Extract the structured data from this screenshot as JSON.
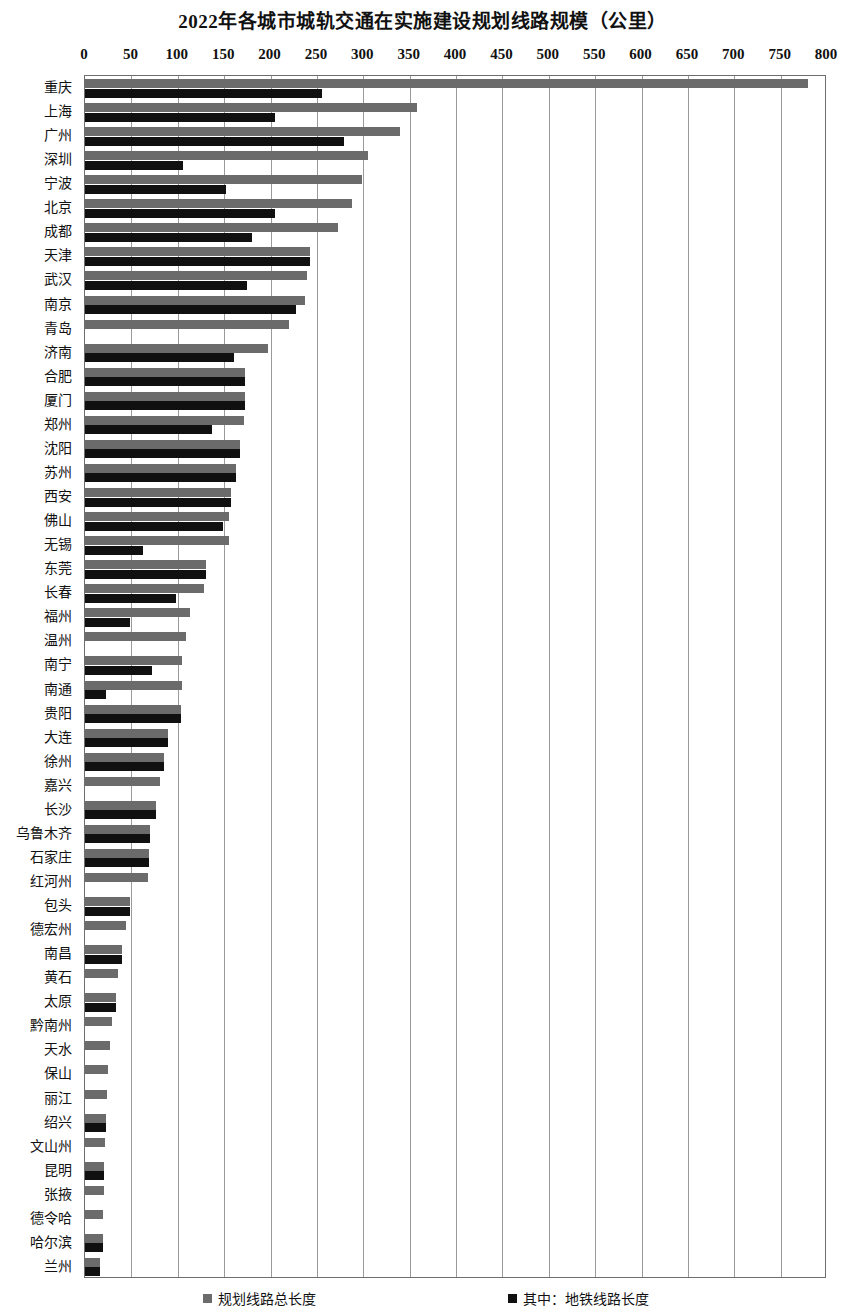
{
  "title": "2022年各城市城轨交通在实施建设规划线路规模（公里）",
  "legend": {
    "total": {
      "label": "规划线路总长度",
      "color": "#6b6b6b",
      "swatch_icon": "square-swatch-gray"
    },
    "metro": {
      "label": "其中：地铁线路长度",
      "color": "#101010",
      "swatch_icon": "square-swatch-black"
    }
  },
  "axis": {
    "ticks": [
      "0",
      "50",
      "100",
      "150",
      "200",
      "250",
      "300",
      "350",
      "400",
      "450",
      "500",
      "550",
      "600",
      "650",
      "700",
      "750",
      "800"
    ]
  },
  "chart_data": {
    "type": "bar",
    "orientation": "horizontal",
    "title": "2022年各城市城轨交通在实施建设规划线路规模（公里）",
    "xlabel": "",
    "ylabel": "",
    "xlim": [
      0,
      800
    ],
    "xticks": [
      0,
      50,
      100,
      150,
      200,
      250,
      300,
      350,
      400,
      450,
      500,
      550,
      600,
      650,
      700,
      750,
      800
    ],
    "grid": "vertical",
    "legend_position": "bottom",
    "categories": [
      "重庆",
      "上海",
      "广州",
      "深圳",
      "宁波",
      "北京",
      "成都",
      "天津",
      "武汉",
      "南京",
      "青岛",
      "济南",
      "合肥",
      "厦门",
      "郑州",
      "沈阳",
      "苏州",
      "西安",
      "佛山",
      "无锡",
      "东莞",
      "长春",
      "福州",
      "温州",
      "南宁",
      "南通",
      "贵阳",
      "大连",
      "徐州",
      "嘉兴",
      "长沙",
      "乌鲁木齐",
      "石家庄",
      "红河州",
      "包头",
      "德宏州",
      "南昌",
      "黄石",
      "太原",
      "黔南州",
      "天水",
      "保山",
      "丽江",
      "绍兴",
      "文山州",
      "昆明",
      "张掖",
      "德令哈",
      "哈尔滨",
      "兰州"
    ],
    "series": [
      {
        "name": "规划线路总长度",
        "color": "#6b6b6b",
        "values": [
          780,
          358,
          340,
          305,
          299,
          288,
          273,
          243,
          239,
          237,
          220,
          197,
          173,
          172,
          171,
          167,
          163,
          157,
          155,
          155,
          130,
          128,
          113,
          109,
          105,
          105,
          104,
          89,
          85,
          81,
          77,
          70,
          69,
          68,
          49,
          44,
          40,
          36,
          33,
          29,
          27,
          25,
          24,
          23,
          22,
          21,
          20,
          19,
          19,
          16
        ]
      },
      {
        "name": "其中：地铁线路长度",
        "color": "#101010",
        "values": [
          255,
          205,
          279,
          106,
          152,
          205,
          180,
          243,
          175,
          227,
          0,
          161,
          173,
          172,
          137,
          167,
          163,
          157,
          149,
          62,
          130,
          98,
          49,
          0,
          72,
          23,
          104,
          89,
          85,
          0,
          77,
          70,
          69,
          0,
          49,
          0,
          40,
          0,
          33,
          0,
          0,
          0,
          0,
          23,
          0,
          21,
          0,
          0,
          19,
          16
        ]
      }
    ]
  }
}
